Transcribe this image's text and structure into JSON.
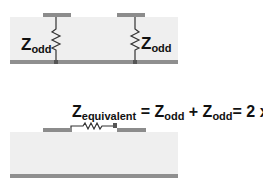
{
  "top_diagram": {
    "left_label": {
      "main": "Z",
      "sub": "odd"
    },
    "right_label": {
      "main": "Z",
      "sub": "odd"
    }
  },
  "bottom_diagram": {
    "equation": {
      "z": "Z",
      "equiv_sub": "equivalent",
      "eq1": " = ",
      "z2": "Z",
      "odd_sub1": "odd",
      "plus": " + ",
      "z3": "Z",
      "odd_sub2": "odd",
      "eq2": "= 2 x ",
      "z4": "Z",
      "odd_sub3": "odd"
    }
  },
  "colors": {
    "substrate": "#efefef",
    "trace": "#8c8c8c",
    "ground": "#8f8f8f",
    "resistor": "#333333"
  }
}
